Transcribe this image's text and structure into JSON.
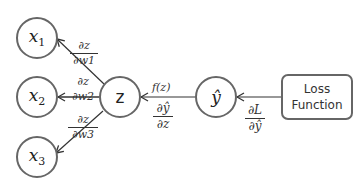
{
  "nodes": {
    "x1": {
      "name": "x",
      "sub": "1"
    },
    "x2": {
      "name": "x",
      "sub": "2"
    },
    "x3": {
      "name": "x",
      "sub": "3"
    },
    "z": {
      "label": "z"
    },
    "yhat": {
      "label": "ŷ"
    },
    "loss": {
      "line1": "Loss",
      "line2": "Function"
    }
  },
  "edges": {
    "dz_dw1": {
      "num": "∂z",
      "den": "∂w1"
    },
    "dz_dw2": {
      "num": "∂z",
      "den": "∂w2"
    },
    "dz_dw3": {
      "num": "∂z",
      "den": "∂w3"
    },
    "fz": {
      "label": "f(z)"
    },
    "dyhat_dz": {
      "num": "∂ŷ",
      "den": "∂z"
    },
    "dL_dyhat": {
      "num": "∂L",
      "den": "∂ŷ"
    }
  },
  "colors": {
    "stroke": "#666666",
    "arrow": "#333333",
    "text": "#222222"
  }
}
